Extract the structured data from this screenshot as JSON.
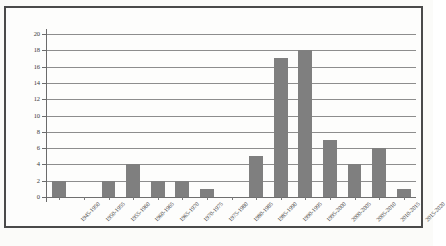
{
  "chart_data": {
    "type": "bar",
    "title": "",
    "subtitle": "",
    "xlabel": "",
    "ylabel": "",
    "categories": [
      "1945-1950",
      "1950-1955",
      "1955-1960",
      "1960-1965",
      "1965-1970",
      "1970-1975",
      "1975-1980",
      "1980-1985",
      "1985-1990",
      "1990-1995",
      "1995-2000",
      "2000-2005",
      "2005-2010",
      "2010-2015",
      "2015-2020"
    ],
    "values": [
      2,
      0,
      2,
      4,
      2,
      2,
      1,
      0,
      5,
      17,
      18,
      7,
      4,
      6,
      1
    ],
    "ylim": [
      0,
      20
    ],
    "ytick_step": 2,
    "yticks": [
      0,
      2,
      4,
      6,
      8,
      10,
      12,
      14,
      16,
      18,
      20
    ],
    "ytick_labels": [
      "0",
      "2",
      "4",
      "6",
      "8",
      "10",
      "12",
      "14",
      "16",
      "18",
      "20"
    ],
    "grid": true,
    "grid_axis": "y",
    "legend": false,
    "legend_position": "none",
    "bar_color": "#7f7f7f",
    "gridline_color": "#8d8d8d",
    "axis_color": "#6b6b6b",
    "frame_color": "#4a4a4a",
    "background_color": "#fdfdfc",
    "xtick_rotation": -45,
    "annotations": []
  }
}
